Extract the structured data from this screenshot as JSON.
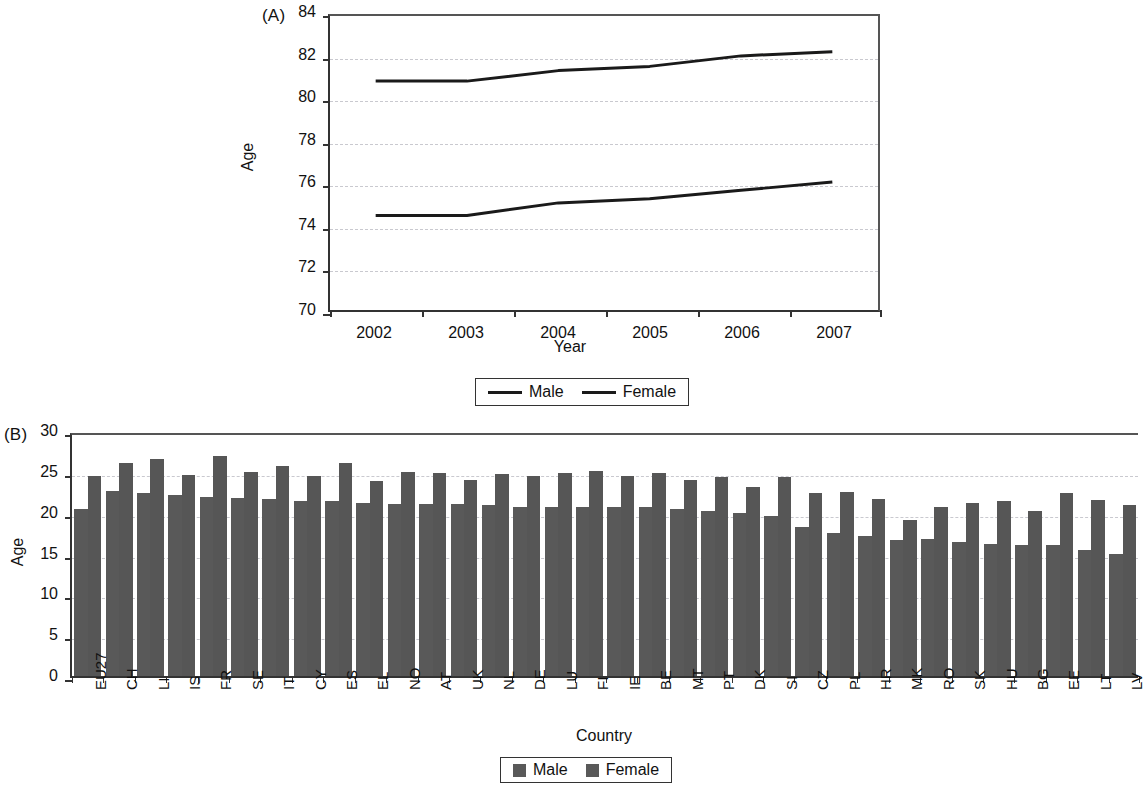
{
  "figure": {
    "panel_a_tag": "(A)",
    "panel_b_tag": "(B)"
  },
  "chart_data": [
    {
      "type": "line",
      "panel": "(A)",
      "title": "",
      "xlabel": "Year",
      "ylabel": "Age",
      "ylim": [
        70,
        84
      ],
      "yticks": [
        70,
        72,
        74,
        76,
        78,
        80,
        82,
        84
      ],
      "categories": [
        "2002",
        "2003",
        "2004",
        "2005",
        "2006",
        "2007"
      ],
      "grid": true,
      "legend_position": "bottom",
      "series": [
        {
          "name": "Male",
          "values": [
            74.5,
            74.5,
            75.1,
            75.3,
            75.7,
            76.1
          ]
        },
        {
          "name": "Female",
          "values": [
            80.9,
            80.9,
            81.4,
            81.6,
            82.1,
            82.3
          ]
        }
      ],
      "legend": [
        "Male",
        "Female"
      ]
    },
    {
      "type": "bar",
      "panel": "(B)",
      "title": "",
      "xlabel": "Country",
      "ylabel": "Age",
      "ylim": [
        0,
        30
      ],
      "yticks": [
        0,
        5,
        10,
        15,
        20,
        25,
        30
      ],
      "grid": true,
      "legend_position": "bottom",
      "categories": [
        "EU27",
        "CH",
        "LI",
        "IS",
        "FR",
        "SE",
        "IT",
        "CY",
        "ES",
        "EL",
        "NO",
        "AT",
        "UK",
        "NL",
        "DE",
        "LU",
        "FI",
        "IE",
        "BE",
        "MT",
        "PT",
        "DK",
        "SI",
        "CZ",
        "PL",
        "HR",
        "MK",
        "RO",
        "SK",
        "HU",
        "BG",
        "EE",
        "LT",
        "LV"
      ],
      "series": [
        {
          "name": "Male",
          "values": [
            20.8,
            23.0,
            22.8,
            22.5,
            22.3,
            22.1,
            22.0,
            21.8,
            21.8,
            21.5,
            21.4,
            21.4,
            21.4,
            21.3,
            21.0,
            21.0,
            21.0,
            21.0,
            21.0,
            20.8,
            20.5,
            20.3,
            19.9,
            18.6,
            17.8,
            17.4,
            16.9,
            17.0,
            16.7,
            16.4,
            16.3,
            16.3,
            15.7,
            15.2
          ]
        },
        {
          "name": "Female",
          "values": [
            24.9,
            26.5,
            27.0,
            25.0,
            27.4,
            25.4,
            26.2,
            24.9,
            26.5,
            24.3,
            25.4,
            25.3,
            24.4,
            25.1,
            24.9,
            25.3,
            25.5,
            24.9,
            25.3,
            24.4,
            24.8,
            23.5,
            24.8,
            22.8,
            22.9,
            22.0,
            19.4,
            21.1,
            21.5,
            21.8,
            20.5,
            22.8,
            21.9,
            21.3
          ]
        }
      ],
      "legend": [
        "Male",
        "Female"
      ]
    }
  ],
  "panel_a": {
    "ylabel": "Age",
    "xlabel": "Year",
    "yticks": [
      "84",
      "82",
      "80",
      "78",
      "76",
      "74",
      "72",
      "70"
    ],
    "xticks": [
      "2002",
      "2003",
      "2004",
      "2005",
      "2006",
      "2007"
    ],
    "legend": {
      "male": "Male",
      "female": "Female"
    }
  },
  "panel_b": {
    "ylabel": "Age",
    "xlabel": "Country",
    "yticks": [
      "30",
      "25",
      "20",
      "15",
      "10",
      "5",
      "0"
    ],
    "legend": {
      "male": "Male",
      "female": "Female"
    }
  },
  "colors": {
    "bar_male": "#595959",
    "bar_female": "#565656",
    "line": "#1a1a1a",
    "grid": "#c9c9cf",
    "axis": "#333333"
  }
}
